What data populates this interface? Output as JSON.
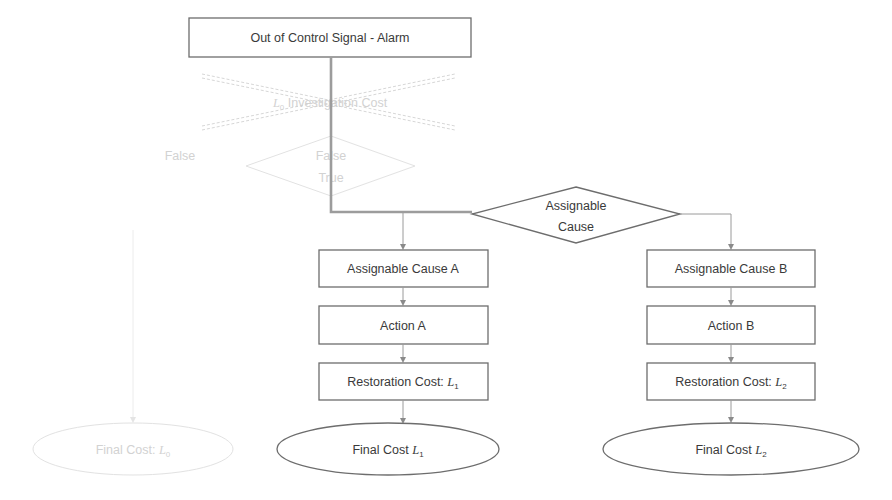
{
  "diagram": {
    "type": "flowchart",
    "top_box": {
      "label": "Out of Control Signal - Alarm"
    },
    "crossed_out_step": {
      "label_math": "L",
      "label_sub": "0",
      "label_text": " Investigation Cost",
      "state": "crossed-out"
    },
    "faint_decision": {
      "line1": "False",
      "line2": "True"
    },
    "faint_branch_label": "False",
    "decision": {
      "line1": "Assignable",
      "line2": "Cause"
    },
    "branch_a": {
      "cause": "Assignable Cause A",
      "action": "Action A",
      "restoration_text": "Restoration  Cost: ",
      "restoration_math": "L",
      "restoration_sub": "1",
      "final_text": "Final Cost ",
      "final_math": "L",
      "final_sub": "1"
    },
    "branch_b": {
      "cause": "Assignable Cause B",
      "action": "Action B",
      "restoration_text": "Restoration  Cost: ",
      "restoration_math": "L",
      "restoration_sub": "2",
      "final_text": "Final Cost ",
      "final_math": "L",
      "final_sub": "2"
    },
    "faint_final": {
      "text": "Final Cost: ",
      "math": "L",
      "sub": "0"
    },
    "colors": {
      "stroke": "#6d6d6d",
      "connector": "#9a9a9a",
      "text": "#3a3a3a",
      "faded": "#d7d7d7"
    }
  }
}
